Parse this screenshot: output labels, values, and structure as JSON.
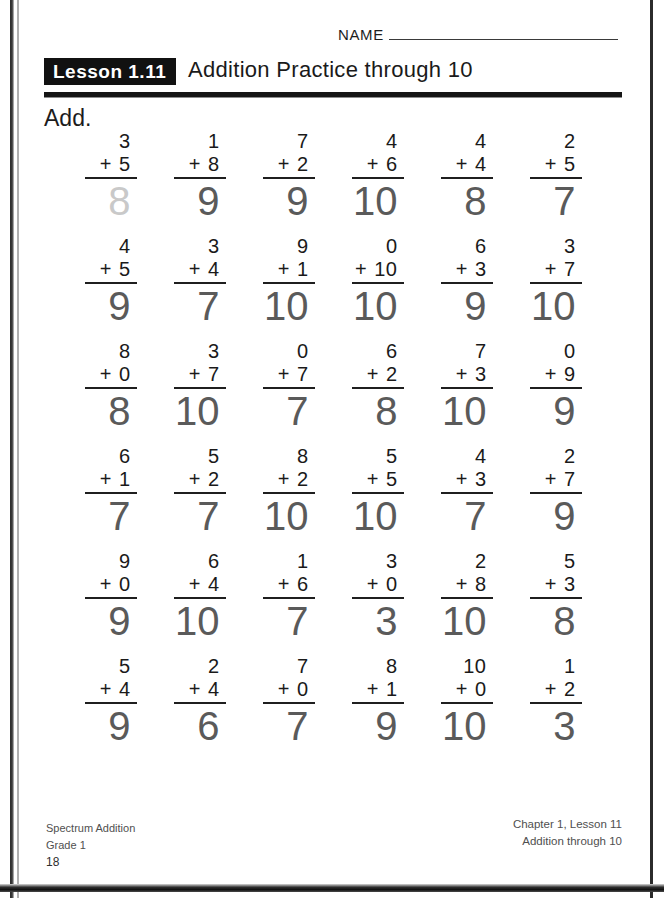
{
  "page": {
    "name_label": "NAME",
    "lesson_badge": "Lesson 1.11",
    "lesson_title": "Addition Practice through 10",
    "instruction": "Add."
  },
  "footer": {
    "left_line1": "Spectrum Addition",
    "left_line2": "Grade 1",
    "page_number": "18",
    "right_line1": "Chapter 1, Lesson 11",
    "right_line2": "Addition through 10"
  },
  "colors": {
    "ink": "#1a1a1a",
    "answer_gray": "#5a5a5a",
    "traced_gray": "#c9c9c9",
    "badge_bg": "#111111"
  },
  "worksheet": {
    "operator": "+",
    "rows": [
      [
        {
          "top": "3",
          "bottom": "5",
          "answer": "8",
          "traced": true
        },
        {
          "top": "1",
          "bottom": "8",
          "answer": "9",
          "traced": false
        },
        {
          "top": "7",
          "bottom": "2",
          "answer": "9",
          "traced": false
        },
        {
          "top": "4",
          "bottom": "6",
          "answer": "10",
          "traced": false
        },
        {
          "top": "4",
          "bottom": "4",
          "answer": "8",
          "traced": false
        },
        {
          "top": "2",
          "bottom": "5",
          "answer": "7",
          "traced": false
        }
      ],
      [
        {
          "top": "4",
          "bottom": "5",
          "answer": "9",
          "traced": false
        },
        {
          "top": "3",
          "bottom": "4",
          "answer": "7",
          "traced": false
        },
        {
          "top": "9",
          "bottom": "1",
          "answer": "10",
          "traced": false
        },
        {
          "top": "0",
          "bottom": "10",
          "answer": "10",
          "traced": false
        },
        {
          "top": "6",
          "bottom": "3",
          "answer": "9",
          "traced": false
        },
        {
          "top": "3",
          "bottom": "7",
          "answer": "10",
          "traced": false
        }
      ],
      [
        {
          "top": "8",
          "bottom": "0",
          "answer": "8",
          "traced": false
        },
        {
          "top": "3",
          "bottom": "7",
          "answer": "10",
          "traced": false
        },
        {
          "top": "0",
          "bottom": "7",
          "answer": "7",
          "traced": false
        },
        {
          "top": "6",
          "bottom": "2",
          "answer": "8",
          "traced": false
        },
        {
          "top": "7",
          "bottom": "3",
          "answer": "10",
          "traced": false
        },
        {
          "top": "0",
          "bottom": "9",
          "answer": "9",
          "traced": false
        }
      ],
      [
        {
          "top": "6",
          "bottom": "1",
          "answer": "7",
          "traced": false
        },
        {
          "top": "5",
          "bottom": "2",
          "answer": "7",
          "traced": false
        },
        {
          "top": "8",
          "bottom": "2",
          "answer": "10",
          "traced": false
        },
        {
          "top": "5",
          "bottom": "5",
          "answer": "10",
          "traced": false
        },
        {
          "top": "4",
          "bottom": "3",
          "answer": "7",
          "traced": false
        },
        {
          "top": "2",
          "bottom": "7",
          "answer": "9",
          "traced": false
        }
      ],
      [
        {
          "top": "9",
          "bottom": "0",
          "answer": "9",
          "traced": false
        },
        {
          "top": "6",
          "bottom": "4",
          "answer": "10",
          "traced": false
        },
        {
          "top": "1",
          "bottom": "6",
          "answer": "7",
          "traced": false
        },
        {
          "top": "3",
          "bottom": "0",
          "answer": "3",
          "traced": false
        },
        {
          "top": "2",
          "bottom": "8",
          "answer": "10",
          "traced": false
        },
        {
          "top": "5",
          "bottom": "3",
          "answer": "8",
          "traced": false
        }
      ],
      [
        {
          "top": "5",
          "bottom": "4",
          "answer": "9",
          "traced": false
        },
        {
          "top": "2",
          "bottom": "4",
          "answer": "6",
          "traced": false
        },
        {
          "top": "7",
          "bottom": "0",
          "answer": "7",
          "traced": false
        },
        {
          "top": "8",
          "bottom": "1",
          "answer": "9",
          "traced": false
        },
        {
          "top": "10",
          "bottom": "0",
          "answer": "10",
          "traced": false
        },
        {
          "top": "1",
          "bottom": "2",
          "answer": "3",
          "traced": false
        }
      ]
    ]
  }
}
